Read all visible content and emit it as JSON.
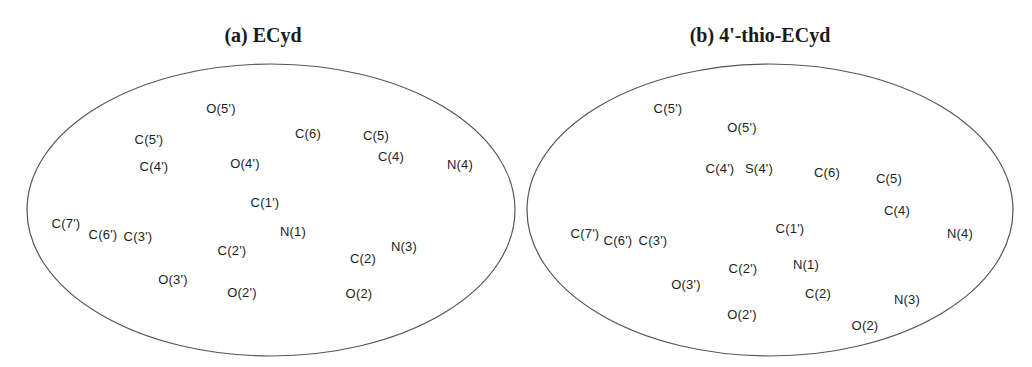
{
  "figure": {
    "panels": [
      {
        "id": "a",
        "title": "(a) ECyd",
        "title_x": 263,
        "ellipse": {
          "cx": 271,
          "cy": 210,
          "rx": 244,
          "ry": 146
        },
        "atoms": [
          {
            "label": "O(5')",
            "x": 221,
            "y": 108
          },
          {
            "label": "C(5')",
            "x": 149,
            "y": 139
          },
          {
            "label": "C(6)",
            "x": 308,
            "y": 133
          },
          {
            "label": "C(5)",
            "x": 376,
            "y": 135
          },
          {
            "label": "C(4)",
            "x": 391,
            "y": 156
          },
          {
            "label": "C(4')",
            "x": 154,
            "y": 166
          },
          {
            "label": "O(4')",
            "x": 245,
            "y": 163
          },
          {
            "label": "N(4)",
            "x": 460,
            "y": 164
          },
          {
            "label": "C(1')",
            "x": 265,
            "y": 202
          },
          {
            "label": "C(7')",
            "x": 66,
            "y": 223
          },
          {
            "label": "C(6')",
            "x": 103,
            "y": 234
          },
          {
            "label": "C(3')",
            "x": 138,
            "y": 236
          },
          {
            "label": "N(1)",
            "x": 293,
            "y": 231
          },
          {
            "label": "N(3)",
            "x": 404,
            "y": 246
          },
          {
            "label": "C(2')",
            "x": 232,
            "y": 250
          },
          {
            "label": "C(2)",
            "x": 363,
            "y": 258
          },
          {
            "label": "O(3')",
            "x": 173,
            "y": 279
          },
          {
            "label": "O(2')",
            "x": 242,
            "y": 292
          },
          {
            "label": "O(2)",
            "x": 359,
            "y": 293
          }
        ]
      },
      {
        "id": "b",
        "title": "(b) 4'-thio-ECyd",
        "title_x": 760,
        "ellipse": {
          "cx": 770,
          "cy": 210,
          "rx": 243,
          "ry": 146
        },
        "atoms": [
          {
            "label": "C(5')",
            "x": 668,
            "y": 108
          },
          {
            "label": "O(5')",
            "x": 742,
            "y": 127
          },
          {
            "label": "C(4')",
            "x": 720,
            "y": 168
          },
          {
            "label": "S(4')",
            "x": 759,
            "y": 168
          },
          {
            "label": "C(6)",
            "x": 827,
            "y": 172
          },
          {
            "label": "C(5)",
            "x": 889,
            "y": 178
          },
          {
            "label": "C(4)",
            "x": 897,
            "y": 210
          },
          {
            "label": "C(1')",
            "x": 790,
            "y": 228
          },
          {
            "label": "N(4)",
            "x": 960,
            "y": 233
          },
          {
            "label": "C(7')",
            "x": 585,
            "y": 233
          },
          {
            "label": "C(6')",
            "x": 618,
            "y": 240
          },
          {
            "label": "C(3')",
            "x": 653,
            "y": 240
          },
          {
            "label": "C(2')",
            "x": 743,
            "y": 268
          },
          {
            "label": "N(1)",
            "x": 806,
            "y": 264
          },
          {
            "label": "O(3')",
            "x": 686,
            "y": 284
          },
          {
            "label": "C(2)",
            "x": 818,
            "y": 293
          },
          {
            "label": "N(3)",
            "x": 907,
            "y": 299
          },
          {
            "label": "O(2')",
            "x": 742,
            "y": 314
          },
          {
            "label": "O(2)",
            "x": 865,
            "y": 325
          }
        ]
      }
    ],
    "colors": {
      "stroke": "#555555",
      "text": "#1e1e1e",
      "background": "#ffffff"
    }
  }
}
